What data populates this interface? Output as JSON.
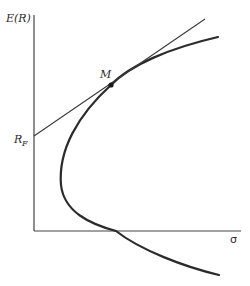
{
  "diagram": {
    "y_axis_label": "E(R)",
    "x_axis_label": "σ",
    "risk_free_label": "R",
    "risk_free_subscript": "F",
    "tangency_label": "M",
    "colors": {
      "axis": "#444444",
      "curve": "#2b2b2b",
      "line": "#3a3a3a",
      "point": "#1a1a1a",
      "background": "#ffffff"
    }
  },
  "elements": [
    {
      "type": "axis",
      "name": "y-axis",
      "label": "E(R)"
    },
    {
      "type": "axis",
      "name": "x-axis",
      "label": "σ"
    },
    {
      "type": "curve",
      "name": "efficient-frontier",
      "shape": "sideways parabola (hyperbola) opening right"
    },
    {
      "type": "line",
      "name": "capital-market-line",
      "from": "R_F",
      "through": "M"
    },
    {
      "type": "point",
      "name": "market-portfolio",
      "label": "M"
    },
    {
      "type": "point",
      "name": "risk-free-rate",
      "label": "R_F"
    }
  ]
}
